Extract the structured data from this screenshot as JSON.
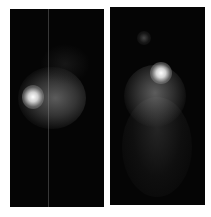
{
  "figure": {
    "panels": [
      {
        "id": "left",
        "description": "Grayscale scan with bright focal spot on upper-left of a diffuse round region",
        "background": "#050505"
      },
      {
        "id": "right",
        "description": "Grayscale scan with bright focal spot above a diffuse region, small faint spot above, dim tail below",
        "background": "#050505"
      }
    ]
  }
}
